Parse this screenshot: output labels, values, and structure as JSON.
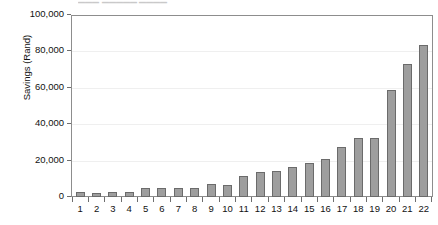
{
  "top_sliver": {
    "text": "▁▁▁  ▁▁▁▁▁  ▁▁▁▁"
  },
  "chart_data": {
    "type": "bar",
    "title": "",
    "subtitle": "",
    "xlabel": "",
    "ylabel": "Savings (Rand)",
    "categories": [
      "1",
      "2",
      "3",
      "4",
      "5",
      "6",
      "7",
      "8",
      "9",
      "10",
      "11",
      "12",
      "13",
      "14",
      "15",
      "16",
      "17",
      "18",
      "19",
      "20",
      "21",
      "22"
    ],
    "values": [
      2500,
      2400,
      2800,
      2500,
      5200,
      4900,
      4800,
      4900,
      7000,
      6600,
      11800,
      13600,
      14100,
      16400,
      18600,
      20800,
      27700,
      32400,
      32200,
      59000,
      73000,
      83700
    ],
    "ylim": [
      0,
      100000
    ],
    "yticks": [
      0,
      20000,
      40000,
      60000,
      80000,
      100000
    ],
    "ytick_labels": [
      "0",
      "20,000",
      "40,000",
      "60,000",
      "80,000",
      "100,000"
    ],
    "grid": true,
    "legend": "none",
    "bar_color": "#9e9e9e",
    "bar_edge_color": "#6b6b6b",
    "axis_color": "#8d8d8d",
    "grid_color": "#efefef",
    "background": "#ffffff"
  }
}
